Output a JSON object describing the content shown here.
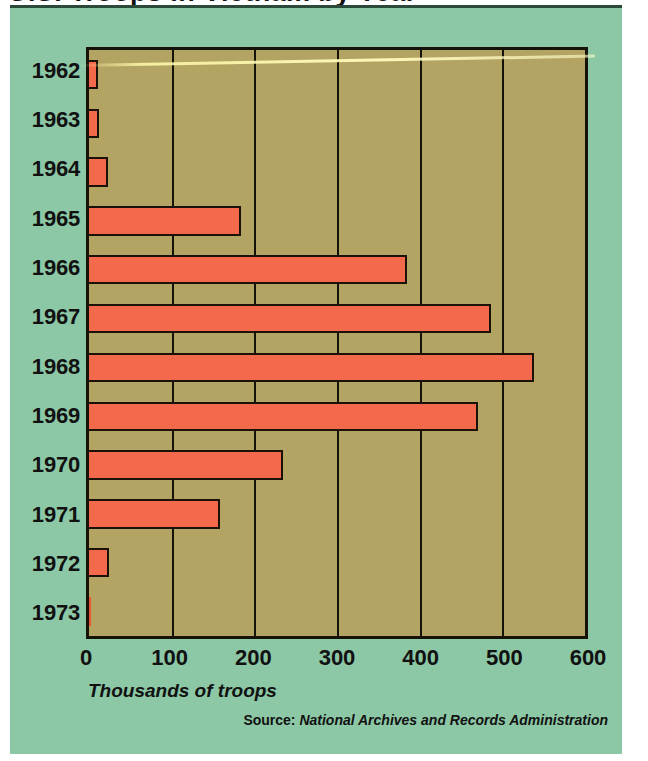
{
  "title_fragment": "U.S. Troops in Vietnam by Year",
  "axis": {
    "x_caption": "Thousands of troops",
    "x_ticks": [
      0,
      100,
      200,
      300,
      400,
      500,
      600
    ],
    "xlim": [
      0,
      600
    ]
  },
  "source": {
    "label": "Source:",
    "body": "National Archives and Records Administration"
  },
  "colors": {
    "panel_background": "#8cc8a6",
    "plot_background": "#b4a463",
    "bar_fill": "#f2694c",
    "bar_outline": "#1a1206",
    "text": "#111111",
    "scan_streak": "#fffcbe"
  },
  "chart_data": {
    "type": "bar",
    "orientation": "horizontal",
    "title": "U.S. Troops in Vietnam by Year",
    "xlabel": "Thousands of troops",
    "ylabel": "",
    "xlim": [
      0,
      600
    ],
    "xticks": [
      0,
      100,
      200,
      300,
      400,
      500,
      600
    ],
    "grid": true,
    "legend": false,
    "units": "thousands of troops",
    "categories": [
      "1962",
      "1963",
      "1964",
      "1965",
      "1966",
      "1967",
      "1968",
      "1969",
      "1970",
      "1971",
      "1972",
      "1973"
    ],
    "values": [
      11,
      12,
      23,
      184,
      385,
      486,
      538,
      471,
      235,
      158,
      24,
      2
    ],
    "source": "National Archives and Records Administration"
  }
}
